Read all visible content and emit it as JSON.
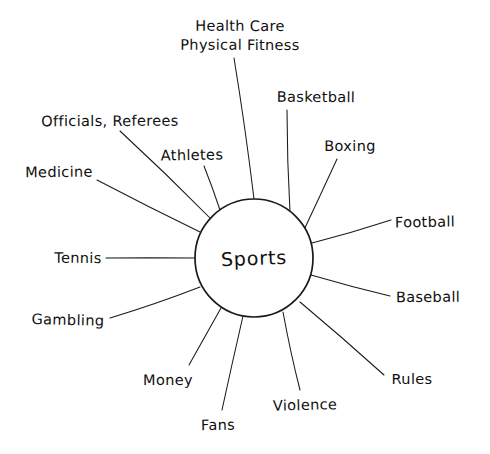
{
  "diagram": {
    "type": "mind-map",
    "title_center": "Sports",
    "background_color": "#ffffff",
    "ink_color": "#0f0f0f",
    "style": "hand-drawn",
    "hub": {
      "label": "Sports",
      "cx": 254,
      "cy": 258,
      "r": 59
    },
    "branch_count": 14,
    "branches": [
      {
        "id": "health-care-physical-fitness",
        "label_line1": "Health Care",
        "label_line2": "Physical Fitness",
        "label_x": 240,
        "label_y": 36,
        "two_line": true,
        "spoke_start_x": 254,
        "spoke_start_y": 199,
        "spoke_end_x": 234,
        "spoke_end_y": 58
      },
      {
        "id": "basketball",
        "label_line1": "Basketball",
        "label_line2": "",
        "label_x": 316,
        "label_y": 97,
        "two_line": false,
        "spoke_start_x": 290,
        "spoke_start_y": 212,
        "spoke_end_x": 287,
        "spoke_end_y": 110
      },
      {
        "id": "boxing",
        "label_line1": "Boxing",
        "label_line2": "",
        "label_x": 350,
        "label_y": 146,
        "two_line": false,
        "spoke_start_x": 303,
        "spoke_start_y": 232,
        "spoke_end_x": 337,
        "spoke_end_y": 159
      },
      {
        "id": "football",
        "label_line1": "Football",
        "label_line2": "",
        "label_x": 425,
        "label_y": 222,
        "two_line": false,
        "spoke_start_x": 312,
        "spoke_start_y": 243,
        "spoke_end_x": 391,
        "spoke_end_y": 220
      },
      {
        "id": "baseball",
        "label_line1": "Baseball",
        "label_line2": "",
        "label_x": 428,
        "label_y": 297,
        "two_line": false,
        "spoke_start_x": 311,
        "spoke_start_y": 275,
        "spoke_end_x": 390,
        "spoke_end_y": 296
      },
      {
        "id": "rules",
        "label_line1": "Rules",
        "label_line2": "",
        "label_x": 412,
        "label_y": 379,
        "two_line": false,
        "spoke_start_x": 300,
        "spoke_start_y": 302,
        "spoke_end_x": 384,
        "spoke_end_y": 375
      },
      {
        "id": "violence",
        "label_line1": "Violence",
        "label_line2": "",
        "label_x": 305,
        "label_y": 405,
        "two_line": false,
        "spoke_start_x": 283,
        "spoke_start_y": 312,
        "spoke_end_x": 300,
        "spoke_end_y": 390
      },
      {
        "id": "fans",
        "label_line1": "Fans",
        "label_line2": "",
        "label_x": 218,
        "label_y": 425,
        "two_line": false,
        "spoke_start_x": 243,
        "spoke_start_y": 316,
        "spoke_end_x": 222,
        "spoke_end_y": 410
      },
      {
        "id": "money",
        "label_line1": "Money",
        "label_line2": "",
        "label_x": 168,
        "label_y": 380,
        "two_line": false,
        "spoke_start_x": 221,
        "spoke_start_y": 308,
        "spoke_end_x": 189,
        "spoke_end_y": 365
      },
      {
        "id": "gambling",
        "label_line1": "Gambling",
        "label_line2": "",
        "label_x": 68,
        "label_y": 320,
        "two_line": false,
        "spoke_start_x": 200,
        "spoke_start_y": 287,
        "spoke_end_x": 110,
        "spoke_end_y": 318
      },
      {
        "id": "tennis",
        "label_line1": "Tennis",
        "label_line2": "",
        "label_x": 78,
        "label_y": 258,
        "two_line": false,
        "spoke_start_x": 195,
        "spoke_start_y": 258,
        "spoke_end_x": 106,
        "spoke_end_y": 258
      },
      {
        "id": "medicine",
        "label_line1": "Medicine",
        "label_line2": "",
        "label_x": 59,
        "label_y": 172,
        "two_line": false,
        "spoke_start_x": 200,
        "spoke_start_y": 232,
        "spoke_end_x": 97,
        "spoke_end_y": 180
      },
      {
        "id": "officials-referees",
        "label_line1": "Officials, Referees",
        "label_line2": "",
        "label_x": 110,
        "label_y": 121,
        "two_line": false,
        "spoke_start_x": 211,
        "spoke_start_y": 219,
        "spoke_end_x": 120,
        "spoke_end_y": 131
      },
      {
        "id": "athletes",
        "label_line1": "Athletes",
        "label_line2": "",
        "label_x": 192,
        "label_y": 155,
        "two_line": false,
        "spoke_start_x": 220,
        "spoke_start_y": 210,
        "spoke_end_x": 204,
        "spoke_end_y": 166
      }
    ]
  }
}
